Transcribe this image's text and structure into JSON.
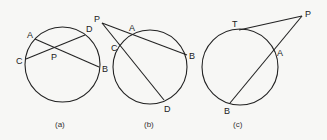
{
  "figures": [
    {
      "id": "a",
      "caption": "(a)",
      "description": "Two chords AB and CD intersecting at interior point P",
      "circle": {
        "cx": 62.5,
        "cy": 64.5,
        "r": 37.5
      },
      "points": {
        "A": "A",
        "B": "B",
        "C": "C",
        "D": "D",
        "P": "P"
      },
      "segments": [
        [
          "A",
          "B"
        ],
        [
          "C",
          "D"
        ]
      ]
    },
    {
      "id": "b",
      "caption": "(b)",
      "description": "Two secants PAB and PCD from an external point P",
      "circle": {
        "cx": 150,
        "cy": 67,
        "r": 37
      },
      "points": {
        "P": "P",
        "A": "A",
        "B": "B",
        "C": "C",
        "D": "D"
      },
      "segments": [
        [
          "P",
          "B"
        ],
        [
          "P",
          "D"
        ]
      ]
    },
    {
      "id": "c",
      "caption": "(c)",
      "description": "Tangent PT and secant PAB from an external point P",
      "circle": {
        "cx": 240,
        "cy": 67,
        "r": 38
      },
      "points": {
        "T": "T",
        "P": "P",
        "A": "A",
        "B": "B"
      },
      "segments": [
        [
          "P",
          "T"
        ],
        [
          "P",
          "B"
        ]
      ]
    }
  ]
}
